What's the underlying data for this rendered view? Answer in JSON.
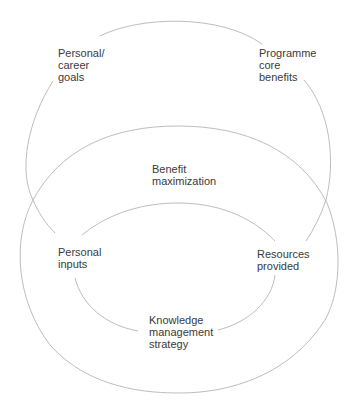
{
  "diagram": {
    "type": "nested-cycles",
    "line_color": "#bdbdbd",
    "text_color": "#3a3a3a",
    "background": "#ffffff",
    "nodes": {
      "personal_career_goals": [
        "Personal/",
        "career",
        "goals"
      ],
      "programme_core_benefits": [
        "Programme",
        "core",
        "benefits"
      ],
      "benefit_maximization": [
        "Benefit",
        "maximization"
      ],
      "personal_inputs": [
        "Personal",
        "inputs"
      ],
      "resources_provided": [
        "Resources",
        "provided"
      ],
      "knowledge_management_strategy": [
        "Knowledge",
        "management",
        "strategy"
      ]
    },
    "cycles": [
      {
        "name": "outer-top-cycle",
        "connects": [
          "Personal/career goals",
          "Programme core benefits",
          "Resources provided",
          "Personal inputs"
        ]
      },
      {
        "name": "benefit-maximization-cycle",
        "connects": [
          "Personal inputs",
          "Benefit maximization",
          "Resources provided"
        ]
      },
      {
        "name": "inner-knowledge-cycle",
        "connects": [
          "Personal inputs",
          "Resources provided",
          "Knowledge management strategy"
        ]
      }
    ]
  }
}
